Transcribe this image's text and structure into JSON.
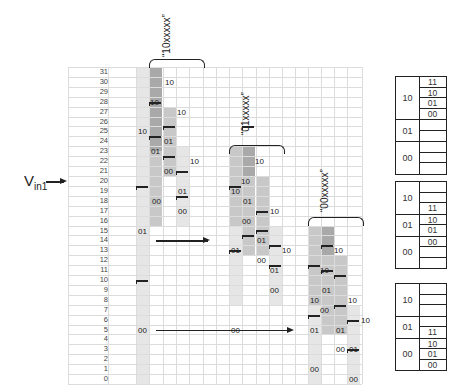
{
  "input_label": {
    "main": "V",
    "sub": "in1"
  },
  "rows": [
    "31",
    "30",
    "29",
    "28",
    "27",
    "26",
    "25",
    "24",
    "23",
    "22",
    "21",
    "20",
    "19",
    "18",
    "17",
    "16",
    "15",
    "14",
    "13",
    "12",
    "11",
    "10",
    "9",
    "8",
    "7",
    "6",
    "5",
    "4",
    "3",
    "2",
    "1",
    "0"
  ],
  "groups": [
    {
      "label": "“10xxxxx”"
    },
    {
      "label": "“01xxxxx”"
    },
    {
      "label": "“00xxxxx”"
    }
  ],
  "colors": {
    "light": "#e6e6e6",
    "mid": "#c8c8c8",
    "dark": "#a9a9a9",
    "darker": "#999999",
    "grid": "#dcdcdc",
    "ink": "#222222"
  },
  "bar_labels": {
    "g1_c0": [
      "10",
      "01",
      "00"
    ],
    "g1_c1": [
      "10",
      "10",
      "01",
      "00"
    ],
    "g1_c2": [
      "10",
      "01",
      "00"
    ],
    "g1_c3": [
      "10",
      "01",
      "00"
    ],
    "g2_c0": [
      "10",
      "01",
      "00"
    ],
    "g2_c1": [
      "10",
      "10",
      "01",
      "00"
    ],
    "g2_c2": [
      "10",
      "01",
      "00"
    ],
    "g2_c3": [
      "10",
      "01",
      "00"
    ],
    "g3_c0": [
      "10",
      "01",
      "00"
    ],
    "g3_c1": [
      "10",
      "10",
      "01",
      "00"
    ],
    "g3_c2": [
      "10",
      "01",
      "00"
    ],
    "g3_c3": [
      "10",
      "01",
      "00"
    ]
  },
  "maps": [
    {
      "groups": [
        {
          "label": "10",
          "slots": [
            "11",
            "10",
            "01",
            "00"
          ]
        },
        {
          "label": "01",
          "slots": [
            "",
            ""
          ]
        },
        {
          "label": "00",
          "slots": [
            "",
            "",
            ""
          ]
        }
      ]
    },
    {
      "groups": [
        {
          "label": "10",
          "slots": [
            "",
            "",
            "11"
          ]
        },
        {
          "label": "01",
          "slots": [
            "10",
            "01"
          ]
        },
        {
          "label": "00",
          "slots": [
            "00",
            "",
            ""
          ]
        }
      ]
    },
    {
      "groups": [
        {
          "label": "10",
          "slots": [
            "",
            "",
            ""
          ]
        },
        {
          "label": "01",
          "slots": [
            "",
            "11"
          ]
        },
        {
          "label": "00",
          "slots": [
            "10",
            "01",
            "00"
          ]
        }
      ]
    }
  ]
}
